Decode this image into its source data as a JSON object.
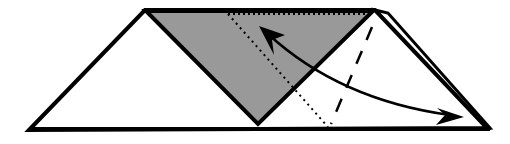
{
  "diagram": {
    "type": "origami-fold-step",
    "colors": {
      "stroke": "#000000",
      "paper_front": "#ffffff",
      "paper_back": "#999999",
      "background": "#ffffff"
    },
    "elements": [
      {
        "name": "base-trapezoid",
        "kind": "paper-outline"
      },
      {
        "name": "gray-flap-triangle",
        "kind": "colored-side-flap"
      },
      {
        "name": "valley-fold-line",
        "kind": "dashed-line"
      },
      {
        "name": "hidden-edge-line",
        "kind": "dotted-line"
      },
      {
        "name": "fold-arrow",
        "kind": "double-headed-curved-arrow"
      }
    ]
  }
}
